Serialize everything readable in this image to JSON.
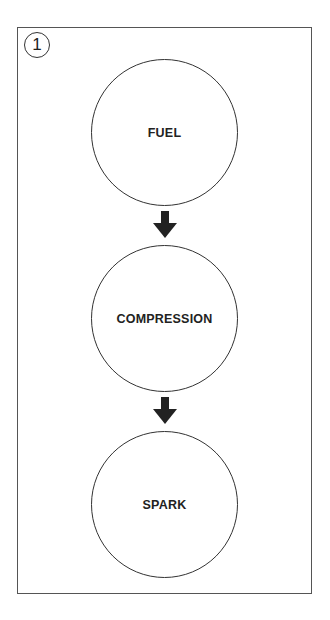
{
  "figure": {
    "number_label": "1",
    "steps": [
      {
        "label": "FUEL"
      },
      {
        "label": "COMPRESSION"
      },
      {
        "label": "SPARK"
      }
    ],
    "arrow_color": "#222222",
    "line_color": "#333333"
  }
}
